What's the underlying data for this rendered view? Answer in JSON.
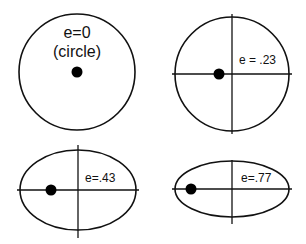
{
  "diagram": {
    "panels": [
      {
        "id": "circle",
        "eccentricity": "0",
        "label_line1": "e=0",
        "label_line2": "(circle)",
        "shape": "circle",
        "has_axes": false
      },
      {
        "id": "ellipse-23",
        "eccentricity": ".23",
        "label": "e = .23",
        "shape": "ellipse",
        "has_axes": true
      },
      {
        "id": "ellipse-43",
        "eccentricity": ".43",
        "label": "e=.43",
        "shape": "ellipse",
        "has_axes": true
      },
      {
        "id": "ellipse-77",
        "eccentricity": ".77",
        "label": "e=.77",
        "shape": "ellipse",
        "has_axes": true
      }
    ],
    "colors": {
      "stroke": "#111111",
      "background": "#ffffff",
      "focus": "#000000"
    }
  }
}
